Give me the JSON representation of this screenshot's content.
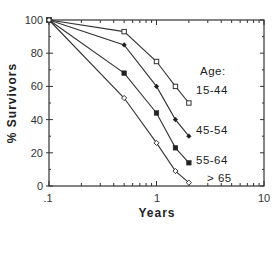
{
  "chart_data": {
    "type": "line",
    "title": "",
    "xlabel": "Years",
    "ylabel": "% Survivors",
    "xscale": "log",
    "xlim": [
      0.1,
      10
    ],
    "ylim": [
      0,
      100
    ],
    "xticks": [
      ".1",
      "1",
      "10"
    ],
    "yticks": [
      "0",
      "20",
      "40",
      "60",
      "80",
      "100"
    ],
    "grid": false,
    "legend_title": "Age:",
    "x": [
      0.1,
      0.5,
      1,
      1.5,
      2
    ],
    "series": [
      {
        "name": "15-44",
        "marker": "open-square",
        "values": [
          100,
          93,
          75,
          60,
          50
        ]
      },
      {
        "name": "45-54",
        "marker": "filled-diamond",
        "values": [
          100,
          85,
          60,
          40,
          30
        ]
      },
      {
        "name": "55-64",
        "marker": "filled-square",
        "values": [
          100,
          68,
          44,
          23,
          14
        ]
      },
      {
        "name": "> 65",
        "marker": "open-diamond",
        "values": [
          100,
          53,
          26,
          9,
          2
        ]
      }
    ]
  },
  "labels": {
    "xlabel": "Years",
    "ylabel": "% Survivors",
    "legend_title": "Age:",
    "x_ticks": [
      ".1",
      "1",
      "10"
    ],
    "y_ticks": [
      "0",
      "20",
      "40",
      "60",
      "80",
      "100"
    ],
    "series": [
      "15-44",
      "45-54",
      "55-64",
      "> 65"
    ]
  },
  "colors": {
    "line": "#333333",
    "axis": "#333333",
    "background": "#ffffff"
  }
}
